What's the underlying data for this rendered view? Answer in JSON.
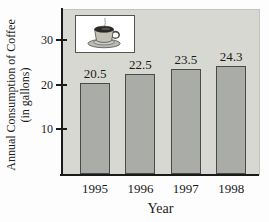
{
  "chart_data": {
    "type": "bar",
    "categories": [
      "1995",
      "1996",
      "1997",
      "1998"
    ],
    "values": [
      20.5,
      22.5,
      23.5,
      24.3
    ],
    "value_labels": [
      "20.5",
      "22.5",
      "23.5",
      "24.3"
    ],
    "xlabel": "Year",
    "ylabel_line1": "Annual Consumption of Coffee",
    "ylabel_line2": "(in gallons)",
    "yticks": [
      10,
      20,
      30
    ],
    "ylim": [
      0,
      37
    ],
    "grid": false,
    "legend": "none",
    "bar_color": "#a9aca7",
    "bar_border_color": "#4a4a48",
    "plot_bg_color": "#d7d8d2",
    "axis_color": "#1a1a1a",
    "icon": "coffee-cup-icon"
  }
}
